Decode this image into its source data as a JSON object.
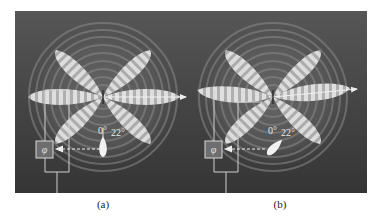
{
  "figure": {
    "background_color": "#3c3c3c",
    "lobe_color": "#d8d8d8",
    "wire_color": "#d0d0d0",
    "panels": [
      {
        "id": "a",
        "caption": "(a)",
        "phase_box_label": "φ",
        "angle_labels": [
          "0°",
          "22°"
        ],
        "source_orientation": "upright",
        "beam_tilt_deg": 0
      },
      {
        "id": "b",
        "caption": "(b)",
        "phase_box_label": "φ",
        "angle_labels": [
          "0°",
          "22°"
        ],
        "source_orientation": "tilted",
        "beam_tilt_deg": -5
      }
    ]
  }
}
